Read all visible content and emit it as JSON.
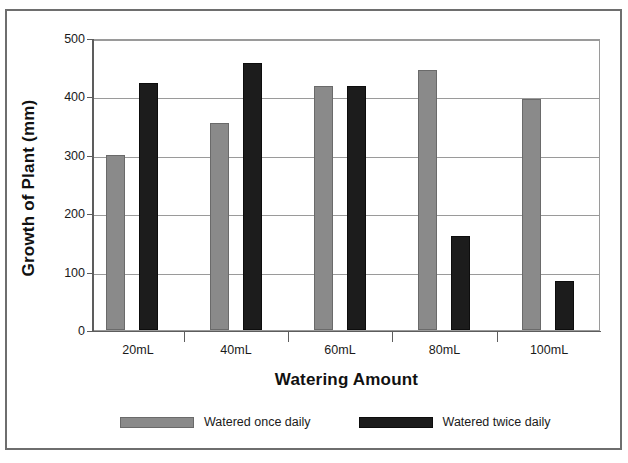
{
  "chart_data": {
    "type": "bar",
    "title": "",
    "xlabel": "Watering Amount",
    "ylabel": "Growth of Plant (mm)",
    "categories": [
      "20mL",
      "40mL",
      "60mL",
      "80mL",
      "100mL"
    ],
    "series": [
      {
        "name": "Watered once daily",
        "color": "#8a8a8a",
        "values": [
          302,
          357,
          421,
          449,
          399
        ]
      },
      {
        "name": "Watered twice daily",
        "color": "#1c1c1c",
        "values": [
          426,
          461,
          420,
          162,
          85
        ]
      }
    ],
    "ylim": [
      0,
      500
    ],
    "yticks": [
      0,
      100,
      200,
      300,
      400,
      500
    ],
    "ytick_labels": [
      "0",
      "100",
      "200",
      "300",
      "400",
      "500"
    ],
    "grid": true,
    "grid_axis": "y",
    "legend_position": "bottom",
    "bar_border_color": "#6a6a6a",
    "axis_color": "#5d5d5d",
    "gridline_color": "#9a9a9a",
    "background": "#ffffff"
  },
  "figure": {
    "border_color": "#6e6e6e"
  }
}
